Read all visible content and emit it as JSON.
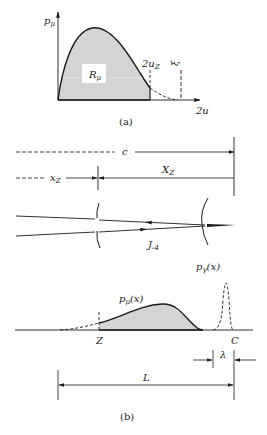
{
  "figure_a": {
    "y_axis_label_base": "p",
    "y_axis_label_sub": "μ",
    "x_axis_label": "2u",
    "region_label_base": "R",
    "region_label_sub": "μ",
    "cutoff_label_base": "2u",
    "cutoff_label_sub": "Z",
    "xi_label": "ξ",
    "caption": "(a)"
  },
  "figure_b": {
    "c_label": "c",
    "xz_small_base": "x",
    "xz_small_sub": "Z",
    "xz_big_base": "X",
    "xz_big_sub": "Z",
    "ray_label_base": "J",
    "ray_label_sub": "-4",
    "p_gamma_base": "p",
    "p_gamma_sub": "γ",
    "p_gamma_arg": "(x)",
    "p_mu_base": "p",
    "p_mu_sub": "μ",
    "p_mu_arg": "(x)",
    "z_label": "Z",
    "c_point_label": "C",
    "lambda_label": "λ",
    "l_label": "L",
    "caption": "(b)"
  },
  "colors": {
    "ink": "#1a1a1a",
    "shade": "#d4d4d4"
  }
}
